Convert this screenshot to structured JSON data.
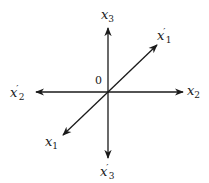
{
  "diagram": {
    "origin": {
      "label": "0",
      "x": 108,
      "y": 92
    },
    "color": "#1a1a1a",
    "axes": [
      {
        "id": "x3",
        "base": "x",
        "sub": "3",
        "prime": "",
        "from": [
          108,
          92
        ],
        "to": [
          108,
          28
        ]
      },
      {
        "id": "x3p",
        "base": "x",
        "sub": "3",
        "prime": "′",
        "from": [
          108,
          92
        ],
        "to": [
          108,
          158
        ]
      },
      {
        "id": "x2",
        "base": "x",
        "sub": "2",
        "prime": "",
        "from": [
          108,
          92
        ],
        "to": [
          183,
          92
        ]
      },
      {
        "id": "x2p",
        "base": "x",
        "sub": "2",
        "prime": "′",
        "from": [
          108,
          92
        ],
        "to": [
          36,
          92
        ]
      },
      {
        "id": "x1p",
        "base": "x",
        "sub": "1",
        "prime": "′",
        "from": [
          108,
          92
        ],
        "to": [
          157,
          45
        ]
      },
      {
        "id": "x1",
        "base": "x",
        "sub": "1",
        "prime": "",
        "from": [
          108,
          92
        ],
        "to": [
          63,
          135
        ]
      }
    ],
    "labels": {
      "x3": {
        "base": "x",
        "sub": "3",
        "prime": ""
      },
      "x3p": {
        "base": "x",
        "sub": "3",
        "prime": "′"
      },
      "x2": {
        "base": "x",
        "sub": "2",
        "prime": ""
      },
      "x2p": {
        "base": "x",
        "sub": "2",
        "prime": "′"
      },
      "x1": {
        "base": "x",
        "sub": "1",
        "prime": ""
      },
      "x1p": {
        "base": "x",
        "sub": "1",
        "prime": "′"
      }
    }
  }
}
